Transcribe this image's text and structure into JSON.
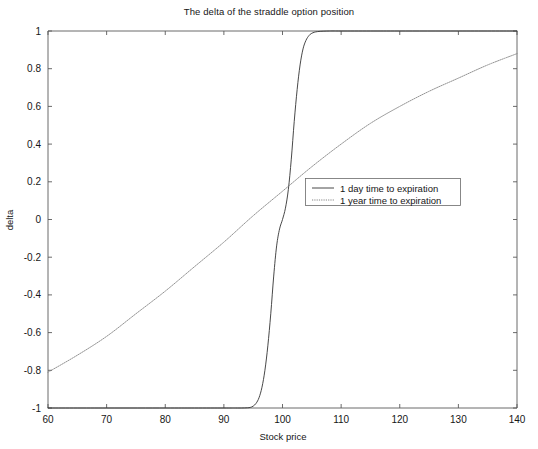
{
  "figure": {
    "title": "The delta of the straddle option position",
    "background_color": "#ffffff",
    "axis_color": "#5a5a5a"
  },
  "chart_data": {
    "type": "line",
    "title": "The delta of the straddle option position",
    "xlabel": "Stock price",
    "ylabel": "delta",
    "xlim": [
      60,
      140
    ],
    "ylim": [
      -1,
      1
    ],
    "xticks": [
      60,
      70,
      80,
      90,
      100,
      110,
      120,
      130,
      140
    ],
    "yticks": [
      -1,
      -0.8,
      -0.6,
      -0.4,
      -0.2,
      0,
      0.2,
      0.4,
      0.6,
      0.8,
      1
    ],
    "xtick_labels": [
      "60",
      "70",
      "80",
      "90",
      "100",
      "110",
      "120",
      "130",
      "140"
    ],
    "ytick_labels": [
      "-1",
      "-0.8",
      "-0.6",
      "-0.4",
      "-0.2",
      "0",
      "0.2",
      "0.4",
      "0.6",
      "0.8",
      "1"
    ],
    "grid": false,
    "legend_position": "center-right",
    "series": [
      {
        "name": "1 day time to expiration",
        "style": "solid",
        "color": "#333333",
        "x": [
          60,
          70,
          80,
          85,
          90,
          92,
          93,
          94,
          94.5,
          95,
          95.5,
          96,
          96.5,
          97,
          97.5,
          98,
          98.5,
          99,
          99.5,
          100,
          100.5,
          101,
          101.5,
          102,
          102.5,
          103,
          103.5,
          104,
          104.5,
          105,
          106,
          108,
          110,
          115,
          120,
          130,
          140
        ],
        "y": [
          -1,
          -1,
          -1,
          -1,
          -1,
          -1,
          -1,
          -0.999,
          -0.997,
          -0.99,
          -0.975,
          -0.945,
          -0.89,
          -0.8,
          -0.67,
          -0.5,
          -0.3,
          -0.14,
          -0.05,
          0,
          0.06,
          0.16,
          0.32,
          0.52,
          0.69,
          0.82,
          0.905,
          0.95,
          0.975,
          0.988,
          0.997,
          1,
          1,
          1,
          1,
          1,
          1
        ]
      },
      {
        "name": "1 year time to expiration",
        "style": "dotted",
        "color": "#777777",
        "x": [
          60,
          65,
          70,
          75,
          80,
          85,
          90,
          95,
          100,
          105,
          110,
          115,
          120,
          125,
          130,
          135,
          140
        ],
        "y": [
          -0.81,
          -0.72,
          -0.62,
          -0.5,
          -0.38,
          -0.25,
          -0.12,
          0.02,
          0.15,
          0.28,
          0.4,
          0.51,
          0.6,
          0.68,
          0.75,
          0.82,
          0.88
        ]
      }
    ],
    "annotations": []
  },
  "legend": {
    "items": [
      {
        "label": "1 day time to expiration",
        "style": "solid",
        "color": "#333333"
      },
      {
        "label": "1 year time to expiration",
        "style": "dotted",
        "color": "#777777"
      }
    ]
  }
}
